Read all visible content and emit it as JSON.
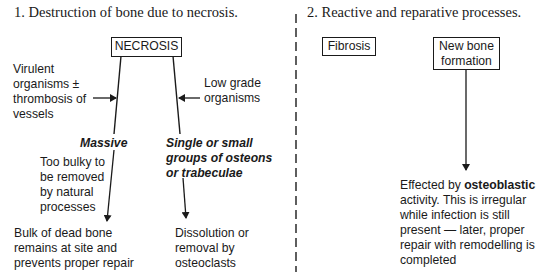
{
  "section1": {
    "heading": "1. Destruction of bone due to necrosis.",
    "root_box": "NECROSIS",
    "left_cause": [
      "Virulent",
      "organisms ±",
      "thrombosis of",
      "vessels"
    ],
    "right_cause": [
      "Low grade",
      "organisms"
    ],
    "left_branch": {
      "label": "Massive",
      "note": [
        "Too bulky to",
        "be removed",
        "by natural",
        "processes"
      ],
      "outcome": [
        "Bulk of dead bone",
        "remains at site and",
        "prevents proper repair"
      ]
    },
    "right_branch": {
      "label": [
        "Single or small",
        "groups of osteons",
        "or trabeculae"
      ],
      "outcome": [
        "Dissolution or",
        "removal by",
        "osteoclasts"
      ]
    }
  },
  "section2": {
    "heading": "2. Reactive and reparative processes.",
    "box_fibrosis": "Fibrosis",
    "box_new_bone": [
      "New bone",
      "formation"
    ],
    "outcome": {
      "line1_prefix": "Effected by ",
      "line1_bold": "osteoblastic",
      "lines": [
        "activity. This is irregular",
        "while infection is still",
        "present — later, proper",
        "repair with remodelling is",
        "completed"
      ]
    }
  },
  "colors": {
    "ink": "#1a1a1a",
    "background": "#ffffff"
  }
}
